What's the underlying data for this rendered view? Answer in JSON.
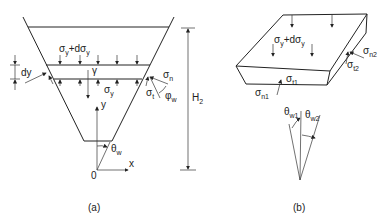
{
  "figure_a": {
    "caption": "(a)",
    "labels": {
      "sigma_top": "σ",
      "sigma_top_sub": "y",
      "sigma_top_plus": "+dσ",
      "sigma_top_plus_sub": "y",
      "dy": "dy",
      "gamma": "γ",
      "sigma_n": "σ",
      "sigma_n_sub": "n",
      "sigma_bottom": "σ",
      "sigma_bottom_sub": "y",
      "sigma_t": "σ",
      "sigma_t_sub": "t",
      "phi_w": "φ",
      "phi_w_sub": "w",
      "height": "H",
      "height_sub": "2",
      "axis_y": "y",
      "axis_x": "x",
      "origin": "0",
      "theta_w": "θ",
      "theta_w_sub": "w"
    }
  },
  "figure_b": {
    "caption": "(b)",
    "labels": {
      "sigma_top": "σ",
      "sigma_top_sub": "y",
      "sigma_top_plus": "+dσ",
      "sigma_top_plus_sub": "y",
      "sigma_n2": "σ",
      "sigma_n2_sub": "n2",
      "sigma_t2": "σ",
      "sigma_t2_sub": "t2",
      "sigma_t1": "σ",
      "sigma_t1_sub": "t1",
      "sigma_n1": "σ",
      "sigma_n1_sub": "n1",
      "theta_w1": "θ",
      "theta_w1_sub": "w1",
      "theta_w2": "θ",
      "theta_w2_sub": "w2"
    }
  }
}
